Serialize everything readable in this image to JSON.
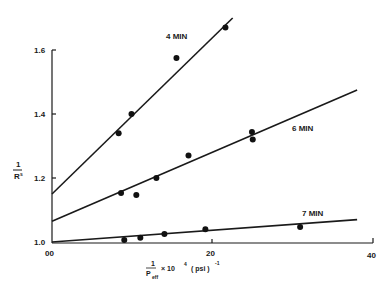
{
  "chart_data": {
    "type": "scatter",
    "title": "",
    "xlabel": "1/P_eff × 10^4 (psi)^-1",
    "ylabel": "1/R_s",
    "xlim": [
      0,
      40
    ],
    "ylim": [
      1.0,
      1.6
    ],
    "x_ticks": [
      "00",
      "20",
      "40"
    ],
    "y_ticks": [
      "1.0",
      "1.2",
      "1.4",
      "1.6"
    ],
    "grid": false,
    "legend": "inline labels",
    "series": [
      {
        "name": "4 MIN",
        "points": [
          [
            8.3,
            1.34
          ],
          [
            9.9,
            1.4
          ],
          [
            15.5,
            1.575
          ],
          [
            21.6,
            1.67
          ]
        ],
        "fit_line": [
          [
            0,
            1.15
          ],
          [
            22.5,
            1.7
          ]
        ]
      },
      {
        "name": "6 MIN",
        "points": [
          [
            8.6,
            1.153
          ],
          [
            10.5,
            1.147
          ],
          [
            13.0,
            1.2
          ],
          [
            17.0,
            1.27
          ],
          [
            24.9,
            1.344
          ],
          [
            25.0,
            1.32
          ]
        ],
        "fit_line": [
          [
            0,
            1.065
          ],
          [
            38,
            1.475
          ]
        ]
      },
      {
        "name": "7 MIN",
        "points": [
          [
            9.0,
            1.006
          ],
          [
            11.0,
            1.013
          ],
          [
            14.0,
            1.025
          ],
          [
            19.1,
            1.04
          ],
          [
            30.9,
            1.047
          ]
        ],
        "fit_line": [
          [
            0,
            1.0
          ],
          [
            38,
            1.07
          ]
        ]
      }
    ]
  },
  "labels": {
    "y_axis_num": "1",
    "y_axis_den": "R",
    "y_axis_sub": "s",
    "x_axis_num": "1",
    "x_axis_den": "P",
    "x_axis_sub": "eff",
    "x_axis_rest": "× 10",
    "x_axis_exp": "4",
    "x_axis_unit": "( psi )",
    "x_axis_unit_exp": "-1",
    "series_4": "4 MIN",
    "series_6": "6 MIN",
    "series_7": "7 MIN",
    "tick_y_10": "1.0",
    "tick_y_12": "1.2",
    "tick_y_14": "1.4",
    "tick_y_16": "1.6",
    "tick_x_0": "00",
    "tick_x_20": "20",
    "tick_x_40": "40"
  }
}
